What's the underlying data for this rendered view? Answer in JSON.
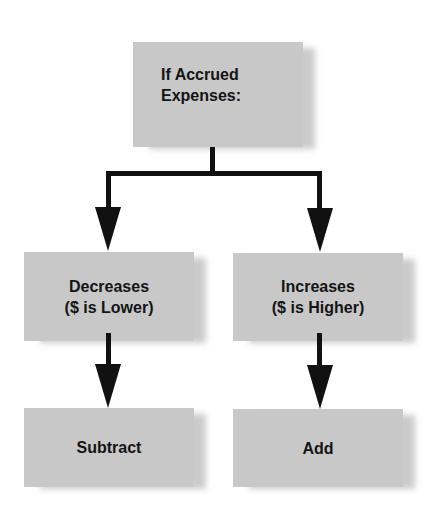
{
  "diagram": {
    "type": "flowchart",
    "colors": {
      "box_fill": "#c8c8c8",
      "connector": "#111111",
      "text": "#141414"
    },
    "root": {
      "line1": "If Accrued",
      "line2": "Expenses:"
    },
    "branches": [
      {
        "condition_line1": "Decreases",
        "condition_line2": "($ is Lower)",
        "result": "Subtract"
      },
      {
        "condition_line1": "Increases",
        "condition_line2": "($ is Higher)",
        "result": "Add"
      }
    ]
  }
}
